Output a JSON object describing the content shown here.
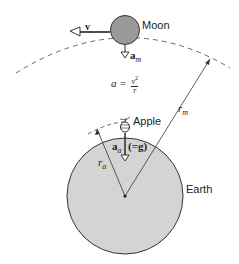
{
  "diagram": {
    "labels": {
      "moon": "Moon",
      "apple": "Apple",
      "earth": "Earth",
      "velocity": "v",
      "moon_accel": "a",
      "moon_accel_sub": "m",
      "apple_accel": "a",
      "apple_accel_sub": "a",
      "apple_accel_note": "(=g)",
      "r_moon": "r",
      "r_moon_sub": "m",
      "r_apple": "r",
      "r_apple_sub": "a",
      "formula_lhs": "a =",
      "formula_num": "v",
      "formula_exp": "2",
      "formula_den": "r"
    },
    "colors": {
      "moon_fill": "#9a9a9a",
      "earth_fill": "#d4d4d4",
      "stroke": "#333333"
    }
  }
}
